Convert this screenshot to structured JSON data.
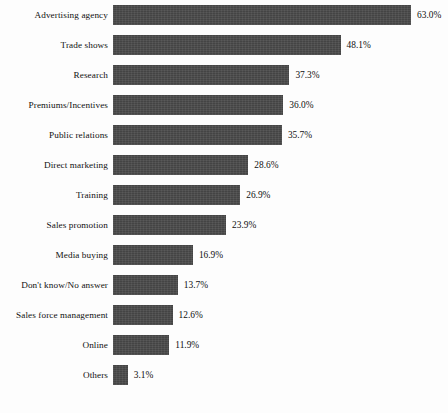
{
  "chart_data": {
    "type": "bar",
    "orientation": "horizontal",
    "title": "",
    "subtitle": "",
    "xlabel": "",
    "ylabel": "",
    "xlim": [
      0,
      63
    ],
    "grid": false,
    "legend": null,
    "value_suffix": "%",
    "bar_color": "#4b4b4b",
    "background_color": "#fdfdfd",
    "categories": [
      "Advertising agency",
      "Trade shows",
      "Research",
      "Premiums/Incentives",
      "Public relations",
      "Direct marketing",
      "Training",
      "Sales promotion",
      "Media buying",
      "Don't know/No answer",
      "Sales force management",
      "Online",
      "Others"
    ],
    "values": [
      63.0,
      48.1,
      37.3,
      36.0,
      35.7,
      28.6,
      26.9,
      23.9,
      16.9,
      13.7,
      12.6,
      11.9,
      3.1
    ],
    "value_labels": [
      "63.0%",
      "48.1%",
      "37.3%",
      "36.0%",
      "35.7%",
      "28.6%",
      "26.9%",
      "23.9%",
      "16.9%",
      "13.7%",
      "12.6%",
      "11.9%",
      "3.1%"
    ]
  }
}
